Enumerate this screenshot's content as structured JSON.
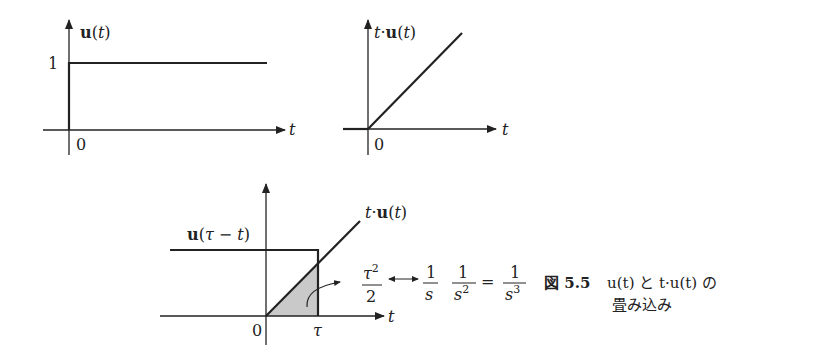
{
  "panel_step": {
    "ylabel": "u(t)",
    "tick_y": "1",
    "origin": "0",
    "xlabel": "t"
  },
  "panel_ramp": {
    "ylabel": "t·u(t)",
    "origin": "0",
    "xlabel": "t"
  },
  "panel_convolution": {
    "step_label": "u(τ − t)",
    "ramp_label": "t·u(t)",
    "origin": "0",
    "tau": "τ",
    "xlabel": "t",
    "area_num": "τ²",
    "area_den": "2",
    "arrow": "↔",
    "f1_num": "1",
    "f1_den": "s",
    "f2_num": "1",
    "f2_den": "s²",
    "equals": "=",
    "f3_num": "1",
    "f3_den": "s³"
  },
  "caption": {
    "figure": "図 5.5",
    "line1": "u(t) と t·u(t) の",
    "line2": "畳み込み"
  }
}
